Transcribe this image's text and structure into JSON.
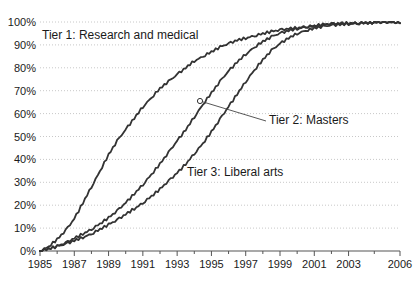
{
  "chart_data": {
    "type": "line",
    "title": "",
    "subtitle": "",
    "xlabel": "",
    "ylabel": "",
    "xlim": [
      1985,
      2006
    ],
    "ylim": [
      0,
      100
    ],
    "grid": true,
    "grid_axis": "y",
    "legend_position": "inline-annotations",
    "y_tick_labels": [
      "100%",
      "90%",
      "80%",
      "70%",
      "60%",
      "50%",
      "40%",
      "30%",
      "20%",
      "10%",
      "0%"
    ],
    "y_tick_values": [
      100,
      90,
      80,
      70,
      60,
      50,
      40,
      30,
      20,
      10,
      0
    ],
    "x_tick_labels": [
      "1985",
      "1987",
      "1989",
      "1991",
      "1993",
      "1995",
      "1997",
      "1999",
      "2001",
      "2003",
      "2006"
    ],
    "x_tick_values": [
      1985,
      1987,
      1989,
      1991,
      1993,
      1995,
      1997,
      1999,
      2001,
      2003,
      2006
    ],
    "x": [
      1985,
      1985.5,
      1986,
      1986.5,
      1987,
      1987.5,
      1988,
      1988.5,
      1989,
      1989.5,
      1990,
      1990.5,
      1991,
      1991.5,
      1992,
      1992.5,
      1993,
      1993.5,
      1994,
      1994.5,
      1995,
      1995.5,
      1996,
      1996.5,
      1997,
      1997.5,
      1998,
      1998.5,
      1999,
      1999.5,
      2000,
      2000.5,
      2001,
      2001.5,
      2002,
      2002.5,
      2003,
      2003.5,
      2004,
      2004.5,
      2005,
      2005.5,
      2006
    ],
    "series": [
      {
        "name": "Tier 1: Research and medical",
        "label": "Tier 1: Research and medical",
        "color": "#333333",
        "values": [
          0,
          2,
          5,
          9,
          14,
          21,
          28,
          35,
          42,
          48,
          53,
          58,
          63,
          67,
          71,
          74,
          77,
          80,
          83,
          85,
          87,
          89,
          90.5,
          92,
          93,
          94,
          95,
          95.8,
          96.5,
          97,
          97.5,
          98,
          98.4,
          98.8,
          99.1,
          99.3,
          99.5,
          99.6,
          99.7,
          99.8,
          99.9,
          100,
          100
        ]
      },
      {
        "name": "Tier 2: Masters",
        "label": "Tier 2: Masters",
        "color": "#333333",
        "marker_year": 1994.2,
        "marker_value": 66,
        "values": [
          0,
          1,
          2,
          3.5,
          5.5,
          7.5,
          9.5,
          12,
          14.5,
          17.5,
          21,
          25,
          29,
          33.5,
          38,
          43,
          48,
          53,
          58.5,
          64,
          69,
          74,
          78.5,
          82.5,
          86,
          89,
          91.5,
          93.5,
          95,
          96.2,
          97.1,
          97.8,
          98.3,
          98.8,
          99.1,
          99.3,
          99.5,
          99.6,
          99.8,
          99.9,
          100,
          100,
          100
        ]
      },
      {
        "name": "Tier 3: Liberal arts",
        "label": "Tier 3: Liberal arts",
        "color": "#333333",
        "values": [
          0,
          1,
          2,
          3,
          4.5,
          6,
          7.5,
          9.5,
          11.5,
          13.5,
          16,
          18.5,
          21,
          24,
          27,
          30.5,
          34,
          38,
          42.5,
          47,
          52,
          57.5,
          63,
          68.5,
          74,
          79,
          83.5,
          87.5,
          90.5,
          93,
          95,
          96.3,
          97.3,
          98,
          98.5,
          98.9,
          99.2,
          99.4,
          99.6,
          99.8,
          99.9,
          100,
          100
        ]
      }
    ],
    "annotations": [
      {
        "text": "Tier 1: Research and medical",
        "x_px": 42,
        "y_px": 29
      },
      {
        "text": "Tier 2: Masters",
        "x_px": 269,
        "y_px": 114,
        "leader_from": [
          200,
          101
        ],
        "leader_to": [
          266,
          121
        ]
      },
      {
        "text": "Tier 3: Liberal arts",
        "x_px": 187,
        "y_px": 166
      }
    ],
    "colors": {
      "line": "#333333",
      "grid": "#c8c8c8",
      "axis": "#555555",
      "text": "#1a1a1a",
      "background": "#ffffff"
    }
  }
}
